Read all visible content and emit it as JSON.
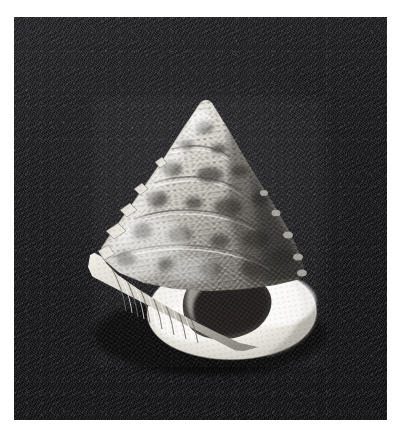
{
  "page": {
    "background_color": "#ffffff",
    "width": 406,
    "height": 442,
    "alt_text": "Black and white photograph of a conical top shell on a dark cloth background"
  },
  "plate": {
    "name": "shell-photograph",
    "backdrop_color": "#16161a",
    "backdrop_highlight_color": "#3c3c40",
    "left": 14,
    "top": 17,
    "width": 373,
    "height": 403
  },
  "subject": {
    "kind": "seashell",
    "common_name": "top shell",
    "orientation": "apertural view, apex up",
    "shell_light_color": "#f2f0ea",
    "shell_mid_color": "#b9b5ad",
    "shell_dark_color": "#4a4740",
    "aperture_color": "#2a2825",
    "apex_point": {
      "x": 200,
      "y": 103
    },
    "base_left_point": {
      "x": 88,
      "y": 300
    },
    "base_right_point": {
      "x": 299,
      "y": 300
    },
    "bottom_point": {
      "x": 215,
      "y": 345
    },
    "features": [
      {
        "name": "apex",
        "label": "apex"
      },
      {
        "name": "spire-whorls",
        "label": "spire whorls"
      },
      {
        "name": "beaded-sculpture",
        "label": "beaded spiral cords"
      },
      {
        "name": "body-whorl",
        "label": "body whorl"
      },
      {
        "name": "aperture",
        "label": "aperture"
      },
      {
        "name": "outer-lip",
        "label": "outer lip"
      },
      {
        "name": "columella",
        "label": "columella"
      },
      {
        "name": "basal-ribs",
        "label": "basal ribs"
      }
    ]
  }
}
